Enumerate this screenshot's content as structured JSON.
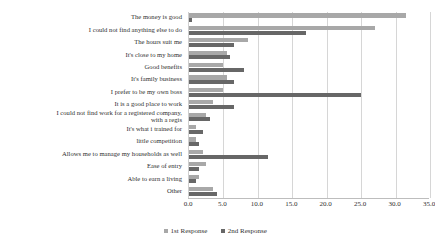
{
  "chart_data": {
    "type": "bar",
    "orientation": "horizontal",
    "title": "",
    "xlabel": "",
    "ylabel": "",
    "xlim": [
      0.0,
      35.0
    ],
    "xticks": [
      "0.0",
      "5.0",
      "10.0",
      "15.0",
      "20.0",
      "25.0",
      "30.0",
      "35.0"
    ],
    "xtick_values": [
      0,
      5,
      10,
      15,
      20,
      25,
      30,
      35
    ],
    "grid": "vertical",
    "legend_position": "bottom",
    "colors": {
      "series_1": "#a8a8a8",
      "series_2": "#676767",
      "gridline": "#d6d6d6",
      "axis": "#bdbdbd",
      "text": "#2f2f2f",
      "background": "#ffffff"
    },
    "categories": [
      "The money is good",
      "I could not find anything else to do",
      "The hours suit me",
      "It's close to my home",
      "Good benefits",
      "It's family business",
      "I prefer to be my own boss",
      "It is a good place to work",
      "I could not find work for a registered company,\nwith a regis",
      "It's what i trained for",
      "little competition",
      "Allows me to manage my households as well",
      "Ease of entry",
      "Able to earn a living",
      "Other"
    ],
    "series": [
      {
        "name": "1st Response",
        "color": "#a8a8a8",
        "values": [
          31.5,
          27.0,
          8.5,
          5.5,
          5.0,
          5.5,
          5.0,
          3.5,
          2.5,
          1.0,
          1.0,
          2.0,
          2.5,
          1.5,
          3.5
        ]
      },
      {
        "name": "2nd Response",
        "color": "#676767",
        "values": [
          0.5,
          17.0,
          6.5,
          6.0,
          8.0,
          6.5,
          25.0,
          6.5,
          3.0,
          2.0,
          1.5,
          11.5,
          1.5,
          1.0,
          4.0
        ]
      }
    ]
  },
  "legend": {
    "items": [
      {
        "label": "1st Response",
        "color": "#a8a8a8"
      },
      {
        "label": "2nd Response",
        "color": "#676767"
      }
    ]
  }
}
